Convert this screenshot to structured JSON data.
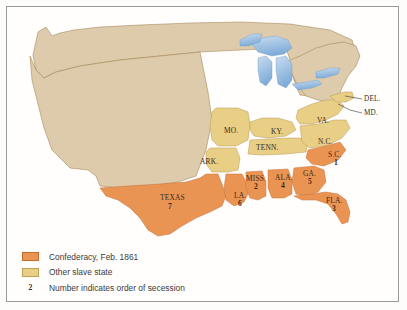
{
  "map": {
    "title": "Secession of the Southern States, 1861",
    "colors": {
      "confederacy": "#ea9454",
      "other_slave_state": "#e9ce86",
      "free_state": "#ddcbab",
      "water": "#9dbfe0",
      "border": "#9a7a4a",
      "frame": "#9a9a9a",
      "background": "#ffffff"
    },
    "states": [
      {
        "id": "texas",
        "label": "TEXAS",
        "number": "7",
        "x": 160,
        "y": 196,
        "group": "confederacy"
      },
      {
        "id": "louisiana",
        "label": "LA.",
        "number": "6",
        "x": 236,
        "y": 196,
        "group": "confederacy"
      },
      {
        "id": "mississippi",
        "label": "MISS.",
        "number": "2",
        "x": 253,
        "y": 177,
        "group": "confederacy"
      },
      {
        "id": "alabama",
        "label": "ALA.",
        "number": "4",
        "x": 282,
        "y": 176,
        "group": "confederacy"
      },
      {
        "id": "georgia",
        "label": "GA.",
        "number": "5",
        "x": 310,
        "y": 172,
        "group": "confederacy"
      },
      {
        "id": "florida",
        "label": "FLA.",
        "number": "3",
        "x": 332,
        "y": 198,
        "group": "confederacy"
      },
      {
        "id": "south-carolina",
        "label": "S.C.",
        "number": "1",
        "x": 335,
        "y": 155,
        "group": "confederacy"
      },
      {
        "id": "arkansas",
        "label": "ARK.",
        "number": "",
        "x": 205,
        "y": 160,
        "group": "other-slave"
      },
      {
        "id": "tennessee",
        "label": "TENN.",
        "number": "",
        "x": 265,
        "y": 146,
        "group": "other-slave"
      },
      {
        "id": "north-carolina",
        "label": "N.C.",
        "number": "",
        "x": 325,
        "y": 140,
        "group": "other-slave"
      },
      {
        "id": "kentucky",
        "label": "KY.",
        "number": "",
        "x": 277,
        "y": 131,
        "group": "other-slave"
      },
      {
        "id": "missouri",
        "label": "MO.",
        "number": "",
        "x": 230,
        "y": 130,
        "group": "other-slave"
      },
      {
        "id": "virginia",
        "label": "VA.",
        "number": "",
        "x": 322,
        "y": 120,
        "group": "other-slave"
      }
    ],
    "leader_labels": [
      {
        "id": "delaware",
        "label": "DEL.",
        "x": 370,
        "y": 98,
        "group": "other-slave"
      },
      {
        "id": "maryland",
        "label": "MD.",
        "x": 370,
        "y": 113,
        "group": "other-slave"
      }
    ]
  },
  "legend": {
    "items": [
      {
        "id": "confederacy",
        "swatch": "confederacy",
        "text": "Confederacy, Feb. 1861"
      },
      {
        "id": "other-slave-state",
        "swatch": "other_slave_state",
        "text": "Other slave state"
      },
      {
        "id": "order-of-secession",
        "swatch": "number",
        "marker": "2",
        "text": "Number indicates order of secession"
      }
    ]
  }
}
